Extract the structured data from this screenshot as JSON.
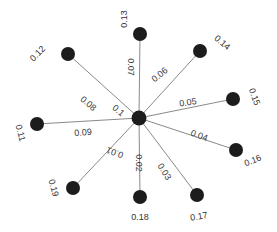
{
  "diagram": {
    "type": "star-graph",
    "hub": {
      "x": 139,
      "y": 118,
      "r": 7.5
    },
    "colors": {
      "node": "#1c1c1c",
      "edge": "#8a8a8a",
      "text": "#3a3a3a"
    },
    "nodes": [
      {
        "id": "n11",
        "label": "0.11",
        "x": 37,
        "y": 124,
        "lx": 20,
        "ly": 133,
        "lrot": 75,
        "edge_label": "0.09",
        "ex": 83,
        "ey": 133,
        "erot": -4
      },
      {
        "id": "n12",
        "label": "0.12",
        "x": 68,
        "y": 54,
        "lx": 38,
        "ly": 54,
        "lrot": -45,
        "edge_label": "0.08",
        "ex": 88,
        "ey": 104,
        "erot": 40
      },
      {
        "id": "n13",
        "label": "0.13",
        "x": 140,
        "y": 34,
        "lx": 125,
        "ly": 19,
        "lrot": -90,
        "edge_label": "0.07",
        "ex": 130,
        "ey": 67,
        "erot": 90
      },
      {
        "id": "n14",
        "label": "0.14",
        "x": 200,
        "y": 51,
        "lx": 222,
        "ly": 43,
        "lrot": 40,
        "edge_label": "0.06",
        "ex": 160,
        "ey": 75,
        "erot": -40
      },
      {
        "id": "n15",
        "label": "0.15",
        "x": 233,
        "y": 99,
        "lx": 254,
        "ly": 97,
        "lrot": 70,
        "edge_label": "0.05",
        "ex": 188,
        "ey": 103,
        "erot": -8
      },
      {
        "id": "n16",
        "label": "0.16",
        "x": 236,
        "y": 150,
        "lx": 253,
        "ly": 161,
        "lrot": -22,
        "edge_label": "0.04",
        "ex": 199,
        "ey": 136,
        "erot": 20
      },
      {
        "id": "n17",
        "label": "0.17",
        "x": 197,
        "y": 195,
        "lx": 199,
        "ly": 217,
        "lrot": -10,
        "edge_label": "0.03",
        "ex": 164,
        "ey": 172,
        "erot": 58
      },
      {
        "id": "n18",
        "label": "0.18",
        "x": 140,
        "y": 197,
        "lx": 140,
        "ly": 218,
        "lrot": 0,
        "edge_label": "0.02",
        "ex": 138,
        "ey": 163,
        "erot": 90
      },
      {
        "id": "n19",
        "label": "0.19",
        "x": 73,
        "y": 188,
        "lx": 53,
        "ly": 188,
        "lrot": 75,
        "edge_label": "0.01",
        "ex": 115,
        "ey": 152,
        "erot": 200
      },
      {
        "id": "n10",
        "label": "",
        "x": 139,
        "y": 118,
        "lx": 0,
        "ly": 0,
        "lrot": 0,
        "edge_label": "0.1",
        "ex": 118,
        "ey": 111,
        "erot": 40
      }
    ]
  }
}
